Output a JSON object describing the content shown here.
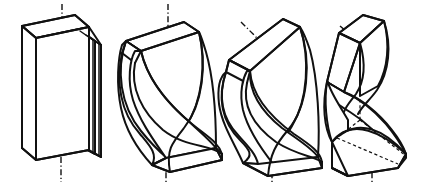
{
  "figure": {
    "background_color": "#ffffff",
    "line_color": "#111111",
    "panel_count": 4,
    "panels": [
      {
        "index": 1,
        "name": "untwisted-block",
        "label": "",
        "twist_degrees": 0,
        "axis": {
          "type": "dash-dot",
          "orientation": "vertical",
          "top_marker": true,
          "bottom_marker": true
        },
        "hidden_lines": false
      },
      {
        "index": 2,
        "name": "twisted-block-vertical-axis",
        "label": "",
        "twist_degrees": 180,
        "axis": {
          "type": "dash-dot",
          "orientation": "vertical",
          "top_marker": true,
          "bottom_marker": true
        },
        "hidden_lines": false
      },
      {
        "index": 3,
        "name": "twisted-block-tilted-top",
        "label": "",
        "twist_degrees": 180,
        "axis": {
          "type": "dash-dot",
          "orientation": "tilted-top-vertical-bottom",
          "top_marker": true,
          "bottom_marker": true
        },
        "hidden_lines": false
      },
      {
        "index": 4,
        "name": "bent-s-curve-block",
        "label": "",
        "twist_degrees": 90,
        "axis": {
          "type": "dash-dot",
          "orientation": "tilted-top-vertical-bottom",
          "top_marker": true,
          "bottom_marker": true
        },
        "hidden_lines": true
      }
    ]
  },
  "captions": {
    "none": ""
  }
}
